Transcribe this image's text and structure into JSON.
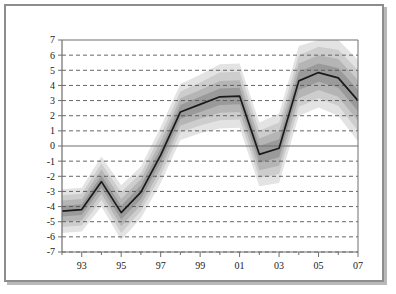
{
  "figure": {
    "axis_title": "% of production capacity",
    "frame_color": "#8d8d8d",
    "background": "#ffffff"
  },
  "chart_data": {
    "type": "line",
    "title": "% of production capacity",
    "subtitle": "",
    "xlabel": "",
    "ylabel": "% of production capacity",
    "grid": true,
    "grid_style": "dashed-horizontal",
    "legend": "none",
    "xlim": [
      1992,
      2007
    ],
    "ylim": [
      -7,
      7
    ],
    "ytick_step": 1,
    "yticks": [
      7,
      6,
      5,
      4,
      3,
      2,
      1,
      0,
      -1,
      -2,
      -3,
      -4,
      -5,
      -6,
      -7
    ],
    "ytick_labels": [
      "7",
      "6",
      "5",
      "4",
      "3",
      "2",
      "1",
      "0",
      "-1",
      "-2",
      "-3",
      "-4",
      "-5",
      "-6",
      "-7"
    ],
    "xticks": [
      1992,
      1993,
      1994,
      1995,
      1996,
      1997,
      1998,
      1999,
      2000,
      2001,
      2002,
      2003,
      2004,
      2005,
      2006,
      2007
    ],
    "xtick_labels": [
      "",
      "93",
      "",
      "95",
      "",
      "97",
      "",
      "99",
      "",
      "01",
      "",
      "03",
      "",
      "05",
      "",
      "07"
    ],
    "x": [
      1992,
      1993,
      1994,
      1995,
      1996,
      1997,
      1998,
      1999,
      2000,
      2001,
      2002,
      2003,
      2004,
      2005,
      2006,
      2007
    ],
    "series": [
      {
        "name": "central estimate",
        "kind": "line",
        "color": "#1a1a1a",
        "values": [
          -4.3,
          -4.2,
          -2.35,
          -4.4,
          -3.05,
          -0.6,
          2.25,
          2.75,
          3.25,
          3.3,
          -0.55,
          -0.15,
          4.3,
          4.85,
          4.5,
          3.0
        ]
      },
      {
        "name": "band 1 (innermost, 30%)",
        "kind": "band",
        "color": "#9a9a9a",
        "lower": [
          -4.65,
          -4.55,
          -2.75,
          -4.85,
          -3.5,
          -1.05,
          1.8,
          2.25,
          2.7,
          2.75,
          -1.1,
          -0.75,
          3.7,
          4.25,
          3.85,
          2.3
        ],
        "upper": [
          -3.95,
          -3.85,
          -1.95,
          -3.95,
          -2.6,
          -0.15,
          2.7,
          3.25,
          3.8,
          3.85,
          0.0,
          0.45,
          4.9,
          5.45,
          5.15,
          3.7
        ]
      },
      {
        "name": "band 2 (60%)",
        "kind": "band",
        "color": "#b5b5b5",
        "lower": [
          -5.0,
          -4.9,
          -3.15,
          -5.3,
          -3.9,
          -1.5,
          1.35,
          1.8,
          2.2,
          2.25,
          -1.6,
          -1.3,
          3.15,
          3.7,
          3.25,
          1.65
        ],
        "upper": [
          -3.6,
          -3.5,
          -1.55,
          -3.5,
          -2.2,
          0.3,
          3.15,
          3.7,
          4.3,
          4.35,
          0.5,
          1.0,
          5.45,
          6.0,
          5.75,
          4.35
        ]
      },
      {
        "name": "band 3 (75%)",
        "kind": "band",
        "color": "#cdcdcd",
        "lower": [
          -5.35,
          -5.25,
          -3.55,
          -5.75,
          -4.3,
          -1.95,
          0.9,
          1.35,
          1.7,
          1.75,
          -2.1,
          -1.85,
          2.6,
          3.15,
          2.65,
          1.0
        ],
        "upper": [
          -3.25,
          -3.15,
          -1.15,
          -3.05,
          -1.8,
          0.75,
          3.6,
          4.2,
          4.85,
          4.9,
          1.0,
          1.55,
          6.0,
          6.55,
          6.35,
          5.0
        ]
      },
      {
        "name": "band 4 (outermost, 90%)",
        "kind": "band",
        "color": "#e3e3e3",
        "lower": [
          -5.75,
          -5.65,
          -4.0,
          -6.2,
          -4.75,
          -2.45,
          0.4,
          0.85,
          1.15,
          1.2,
          -2.65,
          -2.45,
          2.0,
          2.55,
          2.0,
          0.3
        ],
        "upper": [
          -2.85,
          -2.75,
          -0.7,
          -2.6,
          -1.35,
          1.25,
          4.1,
          4.7,
          5.4,
          5.45,
          1.55,
          2.15,
          6.6,
          7.0,
          7.0,
          5.7
        ]
      }
    ]
  }
}
